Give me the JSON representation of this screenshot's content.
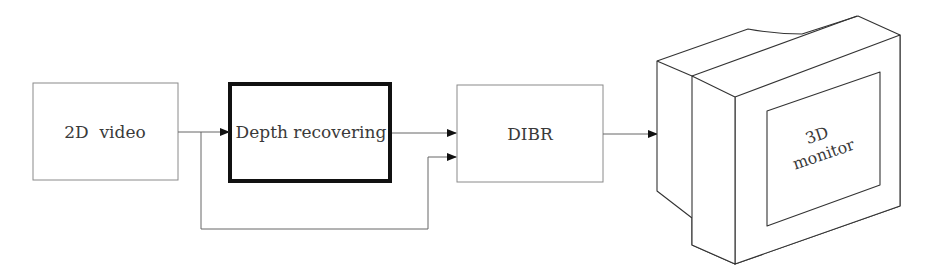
{
  "diagram": {
    "blocks": [
      {
        "id": "video",
        "label": "2D  video"
      },
      {
        "id": "depth",
        "label": "Depth recovering"
      },
      {
        "id": "dibr",
        "label": "DIBR"
      }
    ],
    "monitor": {
      "line1": "3D",
      "line2": "monitor"
    },
    "connections": [
      {
        "from": "2D video",
        "to": "Depth recovering"
      },
      {
        "from": "Depth recovering",
        "to": "DIBR"
      },
      {
        "from": "2D video",
        "to": "DIBR",
        "via": "bypass"
      },
      {
        "from": "DIBR",
        "to": "3D monitor"
      }
    ],
    "colors": {
      "line": "#555555",
      "thick_border": "#111111",
      "text": "#3a3a3a",
      "background": "#ffffff"
    }
  }
}
